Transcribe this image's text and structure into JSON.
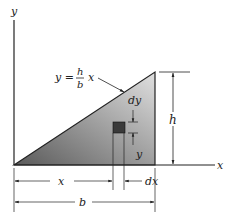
{
  "diagram": {
    "axes": {
      "x_label": "x",
      "y_label": "y"
    },
    "equation": {
      "lhs": "y =",
      "numerator": "h",
      "denominator": "b",
      "var": "x"
    },
    "dimensions": {
      "height": "h",
      "base": "b",
      "x": "x",
      "y": "y",
      "dx": "dx",
      "dy": "dy"
    },
    "colors": {
      "fill_dark": "#6e6e6e",
      "fill_light": "#d9d9d9",
      "stroke": "#222222",
      "element": "#3a3a3a"
    }
  }
}
